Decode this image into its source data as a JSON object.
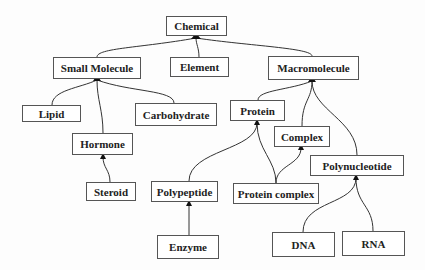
{
  "diagram": {
    "type": "hierarchy",
    "nodes": {
      "chemical": {
        "label": "Chemical"
      },
      "small_molecule": {
        "label": "Small Molecule"
      },
      "element": {
        "label": "Element"
      },
      "macromolecule": {
        "label": "Macromolecule"
      },
      "lipid": {
        "label": "Lipid"
      },
      "carbohydrate": {
        "label": "Carbohydrate"
      },
      "hormone": {
        "label": "Hormone"
      },
      "steroid": {
        "label": "Steroid"
      },
      "protein": {
        "label": "Protein"
      },
      "complex": {
        "label": "Complex"
      },
      "polynucleotide": {
        "label": "Polynucleotide"
      },
      "polypeptide": {
        "label": "Polypeptide"
      },
      "protein_complex": {
        "label": "Protein complex"
      },
      "enzyme": {
        "label": "Enzyme"
      },
      "dna": {
        "label": "DNA"
      },
      "rna": {
        "label": "RNA"
      }
    },
    "edges": [
      {
        "from": "Small Molecule",
        "to": "Chemical"
      },
      {
        "from": "Element",
        "to": "Chemical"
      },
      {
        "from": "Macromolecule",
        "to": "Chemical"
      },
      {
        "from": "Lipid",
        "to": "Small Molecule"
      },
      {
        "from": "Hormone",
        "to": "Small Molecule"
      },
      {
        "from": "Carbohydrate",
        "to": "Small Molecule"
      },
      {
        "from": "Steroid",
        "to": "Hormone"
      },
      {
        "from": "Protein",
        "to": "Macromolecule"
      },
      {
        "from": "Complex",
        "to": "Macromolecule"
      },
      {
        "from": "Polynucleotide",
        "to": "Macromolecule"
      },
      {
        "from": "Polypeptide",
        "to": "Protein"
      },
      {
        "from": "Protein complex",
        "to": "Protein"
      },
      {
        "from": "Protein complex",
        "to": "Complex"
      },
      {
        "from": "Enzyme",
        "to": "Polypeptide"
      },
      {
        "from": "DNA",
        "to": "Polynucleotide"
      },
      {
        "from": "RNA",
        "to": "Polynucleotide"
      }
    ]
  }
}
